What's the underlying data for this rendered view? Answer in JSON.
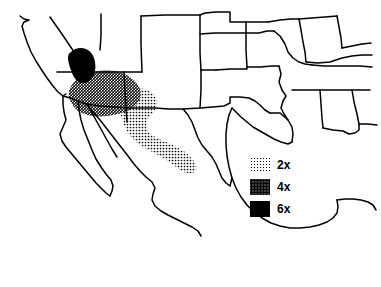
{
  "figure": {
    "type": "thematic-map",
    "region": "Southwestern United States and Mexico",
    "background_color": "#ffffff",
    "line_color": "#000000",
    "width": 381,
    "height": 287
  },
  "legend": {
    "name": "shading-legend",
    "entries": [
      {
        "id": "level-2x",
        "label": "2x",
        "pattern": "light-dot-screen",
        "fill_density": "low"
      },
      {
        "id": "level-4x",
        "label": "4x",
        "pattern": "dense-checker-screen",
        "fill_density": "medium"
      },
      {
        "id": "level-6x",
        "label": "6x",
        "pattern": "solid-black",
        "fill_density": "solid"
      }
    ]
  },
  "shaded_zones": [
    {
      "id": "zone-2x",
      "level": "2x",
      "description": "Border corridor band extending southeast from southern Arizona through southern New Mexico into west Texas"
    },
    {
      "id": "zone-4x",
      "level": "4x",
      "description": "Broad area covering southern Arizona and the lower Colorado River region"
    },
    {
      "id": "zone-6x",
      "level": "6x",
      "description": "Compact core area over southern California"
    }
  ],
  "map_features": {
    "coastlines": [
      "pacific-coast-california",
      "baja-california-peninsula",
      "gulf-of-california",
      "mexico-pacific-coast",
      "gulf-of-mexico-coast",
      "florida-panhandle-coast"
    ],
    "borders": [
      "state-borders-us",
      "us-mexico-international-border"
    ]
  }
}
